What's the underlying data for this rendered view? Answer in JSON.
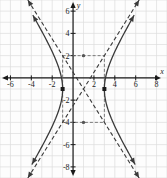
{
  "chart_data": {
    "type": "line",
    "title": "",
    "subtitle": "",
    "xlabel": "x",
    "ylabel": "y",
    "xlim": [
      -7,
      9
    ],
    "ylim": [
      -9,
      7
    ],
    "grid": true,
    "legend": false,
    "grid_step": 1,
    "x_ticks": [
      -6,
      -4,
      -2,
      2,
      4,
      6,
      8
    ],
    "y_ticks": [
      6,
      4,
      2,
      -2,
      -4,
      -6,
      -8
    ],
    "x_tick_labels": [
      "-6",
      "-4",
      "-2",
      "2",
      "4",
      "6",
      "8"
    ],
    "y_tick_labels": [
      "6",
      "4",
      "2",
      "-2",
      "-4",
      "-6",
      "-8"
    ],
    "curve_type": "hyperbola",
    "center": [
      1,
      -1
    ],
    "a": 2,
    "b": 3,
    "orientation": "horizontal",
    "equation": "(x-1)^2/4 - (y+1)^2/9 = 1",
    "vertices": [
      [
        -1,
        -1
      ],
      [
        3,
        -1
      ]
    ],
    "series": [
      {
        "name": "hyperbola-left-branch",
        "style": "solid",
        "color": "#3a3a3a",
        "arrows": "both"
      },
      {
        "name": "hyperbola-right-branch",
        "style": "solid",
        "color": "#3a3a3a",
        "arrows": "both"
      },
      {
        "name": "asymptote-positive-slope",
        "style": "dashed",
        "color": "#3a3a3a",
        "slope": 1.5,
        "intercept": -2.5,
        "arrows": "both"
      },
      {
        "name": "asymptote-negative-slope",
        "style": "dashed",
        "color": "#3a3a3a",
        "slope": -1.5,
        "intercept": 0.5,
        "arrows": "both"
      }
    ],
    "reference_box": {
      "x_range": [
        -1,
        3
      ],
      "y_range": [
        -4,
        2
      ],
      "style": "dashed",
      "color": "#6f6f6f"
    },
    "annotations": [
      {
        "name": "vertex-left",
        "point": [
          -1,
          -1
        ],
        "marker": "square"
      },
      {
        "name": "vertex-right",
        "point": [
          3,
          -1
        ],
        "marker": "square"
      },
      {
        "name": "box-top-marker",
        "point": [
          1,
          2
        ],
        "marker": "dot"
      },
      {
        "name": "box-bottom-marker",
        "point": [
          1,
          -4
        ],
        "marker": "dot"
      }
    ],
    "colors": {
      "grid": "#dcdcdc",
      "axis": "#1a1a1a",
      "curve": "#3a3a3a",
      "dashed": "#4a4a4a",
      "background": "#fdfdfd"
    }
  }
}
